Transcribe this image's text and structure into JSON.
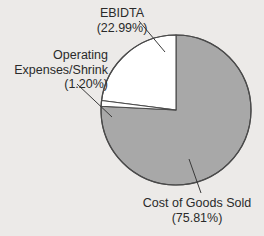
{
  "chart_data": {
    "type": "pie",
    "title": "",
    "categories": [
      "EBIDTA",
      "Operating Expenses/Shrink",
      "Cost of Goods Sold"
    ],
    "values": [
      22.99,
      1.2,
      75.81
    ],
    "value_unit": "%",
    "legend": "none",
    "grid": false,
    "slices": [
      {
        "label": "EBIDTA",
        "value_label": "(22.99%)",
        "value": 22.99,
        "color": "#ffffff",
        "start_angle_deg": 0,
        "sweep_deg": 82.764,
        "direction": "counterclockwise"
      },
      {
        "label": "Operating Expenses/Shrink",
        "value_label": "(1.20%)",
        "value": 1.2,
        "color": "#ffffff",
        "start_angle_deg": 82.764,
        "sweep_deg": 4.32,
        "direction": "counterclockwise"
      },
      {
        "label": "Cost of Goods Sold",
        "value_label": "(75.81%)",
        "value": 75.81,
        "color": "#a8a8a8",
        "start_angle_deg": 87.084,
        "sweep_deg": 272.916,
        "direction": "counterclockwise"
      }
    ]
  },
  "labels": {
    "ebidta": {
      "name": "EBIDTA",
      "percent": "(22.99%)"
    },
    "operating_expenses": {
      "name_line1": "Operating",
      "name_line2": "Expenses/Shrink",
      "percent": "(1.20%)"
    },
    "cost_of_goods_sold": {
      "name": "Cost of Goods Sold",
      "percent": "(75.81%)"
    }
  },
  "colors": {
    "background": "#eceae8",
    "slice_gray": "#a8a8a8",
    "slice_white": "#ffffff",
    "outline": "#4a4a4a",
    "text": "#2a2a2a",
    "leader_line": "#3a3a3a"
  }
}
